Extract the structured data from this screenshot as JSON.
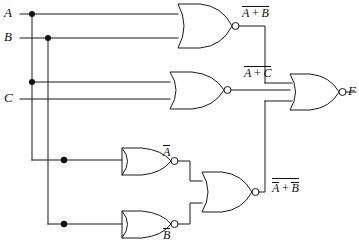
{
  "diagram": {
    "type": "logic-circuit-schematic",
    "line_color": "#1a1a1a",
    "background_color": "#ffffff"
  },
  "inputs": [
    {
      "name": "A",
      "label": "A",
      "y": 14
    },
    {
      "name": "B",
      "label": "B",
      "y": 38
    },
    {
      "name": "C",
      "label": "C",
      "y": 99
    }
  ],
  "output": {
    "name": "F",
    "label": "F"
  },
  "gates": [
    {
      "id": "g1",
      "type": "NOR",
      "inputs": [
        "A",
        "B"
      ],
      "output_label_plain": "A + B",
      "output_label_overbar": "full",
      "expr_left": "A",
      "expr_op": "+",
      "expr_right": "B"
    },
    {
      "id": "g2",
      "type": "NOR",
      "inputs": [
        "A",
        "C"
      ],
      "output_label_plain": "A + C",
      "output_label_overbar": "full",
      "expr_left": "A",
      "expr_op": "+",
      "expr_right": "C"
    },
    {
      "id": "g3",
      "type": "NOR",
      "role": "inverter",
      "inputs": [
        "A",
        "A"
      ],
      "output_label_plain": "A",
      "output_label_overbar": "single"
    },
    {
      "id": "g4",
      "type": "NOR",
      "role": "inverter",
      "inputs": [
        "B",
        "B"
      ],
      "output_label_plain": "B",
      "output_label_overbar": "single"
    },
    {
      "id": "g5",
      "type": "NOR",
      "inputs": [
        "not-A",
        "not-B"
      ],
      "output_label_plain": "A + B",
      "output_label_overbar": "double",
      "expr_left": "A",
      "expr_op": "+",
      "expr_right": "B"
    },
    {
      "id": "g6",
      "type": "NOR",
      "inputs": [
        "g1",
        "g2",
        "g5"
      ],
      "output_label_plain": "F"
    }
  ],
  "labels": {
    "input_a": "A",
    "input_b": "B",
    "input_c": "C",
    "output_f": "F",
    "not_a": "A",
    "not_b": "B",
    "nor_ab_left": "A",
    "nor_ab_op": "+",
    "nor_ab_right": "B",
    "nor_ac_left": "A",
    "nor_ac_op": "+",
    "nor_ac_right": "C",
    "nor_nanb_left": "A",
    "nor_nanb_op": "+",
    "nor_nanb_right": "B"
  }
}
